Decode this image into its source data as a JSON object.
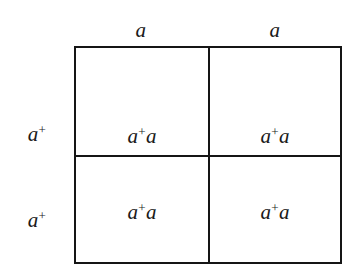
{
  "figure": {
    "name": "punnett-square",
    "background_color": "#ffffff",
    "line_color": "#151515",
    "text_color": "#1a1a1a"
  },
  "axes": {
    "column_headers": [
      {
        "allele": "a",
        "superscript": ""
      },
      {
        "allele": "a",
        "superscript": ""
      }
    ],
    "row_headers": [
      {
        "allele": "a",
        "superscript": "+"
      },
      {
        "allele": "a",
        "superscript": "+"
      }
    ]
  },
  "grid": {
    "rows": 2,
    "columns": 2,
    "cells": [
      [
        {
          "allele_1": "a",
          "superscript_1": "+",
          "allele_2": "a",
          "superscript_2": "",
          "genotype": "a+a"
        },
        {
          "allele_1": "a",
          "superscript_1": "+",
          "allele_2": "a",
          "superscript_2": "",
          "genotype": "a+a"
        }
      ],
      [
        {
          "allele_1": "a",
          "superscript_1": "+",
          "allele_2": "a",
          "superscript_2": "",
          "genotype": "a+a"
        },
        {
          "allele_1": "a",
          "superscript_1": "+",
          "allele_2": "a",
          "superscript_2": "",
          "genotype": "a+a"
        }
      ]
    ]
  }
}
